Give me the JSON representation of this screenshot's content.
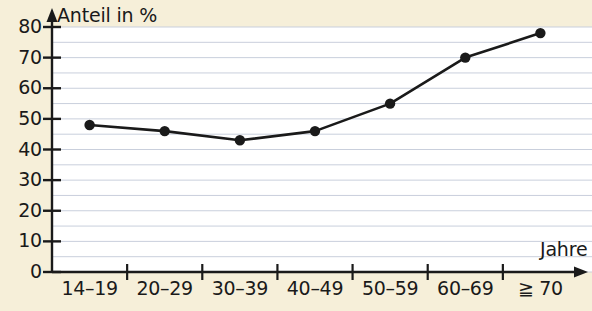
{
  "chart_data": {
    "type": "line",
    "title": "",
    "xlabel": "Jahre",
    "ylabel": "Anteil in %",
    "categories": [
      "14–19",
      "20–29",
      "30–39",
      "40–49",
      "50–59",
      "60–69",
      "≧ 70"
    ],
    "values": [
      48,
      46,
      43,
      46,
      55,
      70,
      78
    ],
    "ylim": [
      0,
      80
    ],
    "yticks": [
      0,
      10,
      20,
      30,
      40,
      50,
      60,
      70,
      80
    ],
    "ytick_labels": [
      "0",
      "10",
      "20",
      "30",
      "40",
      "50",
      "60",
      "70",
      "80"
    ],
    "minor_gridline_step": 5,
    "grid": true,
    "legend": null,
    "marker": "filled-circle",
    "line_color": "#1a1a1a",
    "marker_color": "#1a1a1a",
    "plot_background": "#ffffff",
    "page_background": "#f6efd9",
    "gridline_color": "#c9cfdc"
  },
  "axes": {
    "y_axis_title": "Anteil in %",
    "x_axis_title": "Jahre"
  }
}
